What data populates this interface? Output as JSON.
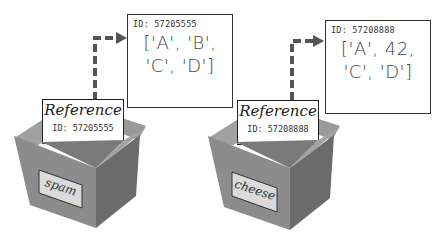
{
  "diagram": {
    "variables": [
      {
        "name": "spam",
        "reference_title": "Reference",
        "reference_id": "ID: 57205555",
        "list_id": "ID: 57205555",
        "list_line1": "['A', 'B',",
        "list_line2": "'C', 'D']"
      },
      {
        "name": "cheese",
        "reference_title": "Reference",
        "reference_id": "ID: 57208888",
        "list_id": "ID: 57208888",
        "list_line1": "['A', 42,",
        "list_line2": "'C', 'D']"
      }
    ],
    "colors": {
      "box_front": "#8a8a8a",
      "box_side": "#6e6e6e",
      "box_flap": "#9d9d9d",
      "arrow": "#555555",
      "label_bg": "#d8d8d8"
    }
  }
}
